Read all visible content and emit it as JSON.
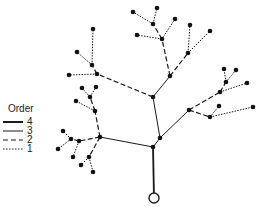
{
  "legend": {
    "title": "Order",
    "items": [
      {
        "label": "4",
        "style": "solid-thick"
      },
      {
        "label": "3",
        "style": "solid-thin"
      },
      {
        "label": "2",
        "style": "dashed"
      },
      {
        "label": "1",
        "style": "dotted"
      }
    ]
  },
  "colors": {
    "line": "#1a1a1a",
    "node": "#111111",
    "background": "#ffffff"
  },
  "tree": {
    "outlet": {
      "x": 154,
      "y": 198
    },
    "nodes": [
      [
        153,
        147
      ],
      [
        153,
        97
      ],
      [
        170,
        76
      ],
      [
        160,
        138
      ],
      [
        189,
        110
      ],
      [
        100,
        137
      ],
      [
        162,
        39
      ],
      [
        137,
        35
      ],
      [
        153,
        24
      ],
      [
        133,
        12
      ],
      [
        157,
        8
      ],
      [
        175,
        19
      ],
      [
        188,
        53
      ],
      [
        190,
        25
      ],
      [
        210,
        31
      ],
      [
        220,
        92
      ],
      [
        226,
        82
      ],
      [
        224,
        69
      ],
      [
        236,
        70
      ],
      [
        247,
        83
      ],
      [
        210,
        117
      ],
      [
        219,
        106
      ],
      [
        253,
        107
      ],
      [
        97,
        74
      ],
      [
        92,
        65
      ],
      [
        93,
        29
      ],
      [
        77,
        52
      ],
      [
        69,
        75
      ],
      [
        95,
        111
      ],
      [
        90,
        97
      ],
      [
        82,
        88
      ],
      [
        96,
        87
      ],
      [
        76,
        101
      ],
      [
        79,
        141
      ],
      [
        71,
        139
      ],
      [
        63,
        131
      ],
      [
        58,
        149
      ],
      [
        73,
        157
      ],
      [
        89,
        157
      ],
      [
        81,
        165
      ],
      [
        93,
        172
      ]
    ],
    "edges": [
      {
        "from": [
          154,
          198
        ],
        "to": [
          153,
          147
        ],
        "order": 4
      },
      {
        "from": [
          153,
          147
        ],
        "to": [
          160,
          138
        ],
        "order": 3
      },
      {
        "from": [
          160,
          138
        ],
        "to": [
          153,
          97
        ],
        "order": 3
      },
      {
        "from": [
          153,
          147
        ],
        "to": [
          100,
          137
        ],
        "order": 3
      },
      {
        "from": [
          160,
          138
        ],
        "to": [
          189,
          110
        ],
        "order": 3
      },
      {
        "from": [
          153,
          97
        ],
        "to": [
          170,
          76
        ],
        "order": 3
      },
      {
        "from": [
          153,
          97
        ],
        "to": [
          97,
          74
        ],
        "order": 2
      },
      {
        "from": [
          170,
          76
        ],
        "to": [
          162,
          39
        ],
        "order": 2
      },
      {
        "from": [
          170,
          76
        ],
        "to": [
          188,
          53
        ],
        "order": 2
      },
      {
        "from": [
          162,
          39
        ],
        "to": [
          137,
          35
        ],
        "order": 1
      },
      {
        "from": [
          162,
          39
        ],
        "to": [
          153,
          24
        ],
        "order": 2
      },
      {
        "from": [
          162,
          39
        ],
        "to": [
          175,
          19
        ],
        "order": 1
      },
      {
        "from": [
          153,
          24
        ],
        "to": [
          133,
          12
        ],
        "order": 1
      },
      {
        "from": [
          153,
          24
        ],
        "to": [
          157,
          8
        ],
        "order": 1
      },
      {
        "from": [
          188,
          53
        ],
        "to": [
          190,
          25
        ],
        "order": 1
      },
      {
        "from": [
          188,
          53
        ],
        "to": [
          210,
          31
        ],
        "order": 1
      },
      {
        "from": [
          189,
          110
        ],
        "to": [
          220,
          92
        ],
        "order": 2
      },
      {
        "from": [
          220,
          92
        ],
        "to": [
          226,
          82
        ],
        "order": 2
      },
      {
        "from": [
          226,
          82
        ],
        "to": [
          224,
          69
        ],
        "order": 1
      },
      {
        "from": [
          226,
          82
        ],
        "to": [
          236,
          70
        ],
        "order": 1
      },
      {
        "from": [
          220,
          92
        ],
        "to": [
          247,
          83
        ],
        "order": 1
      },
      {
        "from": [
          189,
          110
        ],
        "to": [
          210,
          117
        ],
        "order": 2
      },
      {
        "from": [
          210,
          117
        ],
        "to": [
          219,
          106
        ],
        "order": 1
      },
      {
        "from": [
          210,
          117
        ],
        "to": [
          253,
          107
        ],
        "order": 1
      },
      {
        "from": [
          97,
          74
        ],
        "to": [
          92,
          65
        ],
        "order": 2
      },
      {
        "from": [
          92,
          65
        ],
        "to": [
          93,
          29
        ],
        "order": 1
      },
      {
        "from": [
          92,
          65
        ],
        "to": [
          77,
          52
        ],
        "order": 1
      },
      {
        "from": [
          97,
          74
        ],
        "to": [
          69,
          75
        ],
        "order": 1
      },
      {
        "from": [
          100,
          137
        ],
        "to": [
          95,
          111
        ],
        "order": 2
      },
      {
        "from": [
          95,
          111
        ],
        "to": [
          90,
          97
        ],
        "order": 2
      },
      {
        "from": [
          90,
          97
        ],
        "to": [
          82,
          88
        ],
        "order": 1
      },
      {
        "from": [
          90,
          97
        ],
        "to": [
          96,
          87
        ],
        "order": 1
      },
      {
        "from": [
          95,
          111
        ],
        "to": [
          76,
          101
        ],
        "order": 1
      },
      {
        "from": [
          100,
          137
        ],
        "to": [
          79,
          141
        ],
        "order": 2
      },
      {
        "from": [
          79,
          141
        ],
        "to": [
          71,
          139
        ],
        "order": 2
      },
      {
        "from": [
          71,
          139
        ],
        "to": [
          63,
          131
        ],
        "order": 1
      },
      {
        "from": [
          71,
          139
        ],
        "to": [
          58,
          149
        ],
        "order": 1
      },
      {
        "from": [
          79,
          141
        ],
        "to": [
          73,
          157
        ],
        "order": 1
      },
      {
        "from": [
          100,
          137
        ],
        "to": [
          89,
          157
        ],
        "order": 2
      },
      {
        "from": [
          89,
          157
        ],
        "to": [
          81,
          165
        ],
        "order": 1
      },
      {
        "from": [
          89,
          157
        ],
        "to": [
          93,
          172
        ],
        "order": 1
      }
    ]
  }
}
